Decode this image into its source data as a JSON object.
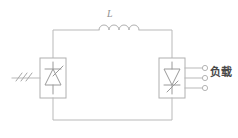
{
  "diagram": {
    "labels": {
      "inductor": "L",
      "load": "负载"
    },
    "colors": {
      "wire": "#b9b9b9",
      "box_border": "#b0b0b0",
      "symbol": "#9a9a9a",
      "text": "#4a4a4a",
      "label_inductor": "#8f8f8f",
      "background": "#ffffff"
    },
    "components": [
      {
        "name": "ac-source",
        "type": "three-phase-source-hatch",
        "hatch_marks": 3,
        "position": "left"
      },
      {
        "name": "rectifier-block",
        "type": "thyristor-converter-box",
        "symbol": "thyristor-up",
        "position": "left"
      },
      {
        "name": "dc-link-inductor",
        "type": "inductor",
        "label": "L",
        "coil_bumps": 4,
        "position": "top-center"
      },
      {
        "name": "inverter-block",
        "type": "thyristor-converter-box",
        "symbol": "thyristor-down",
        "position": "right"
      },
      {
        "name": "load-terminals",
        "type": "output-terminals",
        "count": 3,
        "label": "负载",
        "position": "right"
      }
    ],
    "wires": [
      "top-rail-left-to-inductor",
      "inductor-to-top-rail-right",
      "left-box-to-bottom-rail",
      "bottom-rail",
      "bottom-rail-to-right-box"
    ]
  }
}
